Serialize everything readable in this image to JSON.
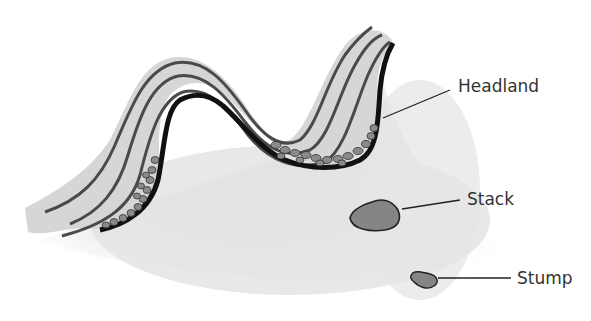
{
  "diagram": {
    "labels": {
      "headland": "Headland",
      "stack": "Stack",
      "stump": "Stump"
    },
    "colors": {
      "sea_fill": "#e6e6e6",
      "land_fill": "#d4d4d4",
      "strata_line": "#4a4a4a",
      "cliff_edge": "#111111",
      "pebble_fill": "#8a8a8a",
      "rock_fill": "#858585",
      "text": "#333333"
    }
  }
}
